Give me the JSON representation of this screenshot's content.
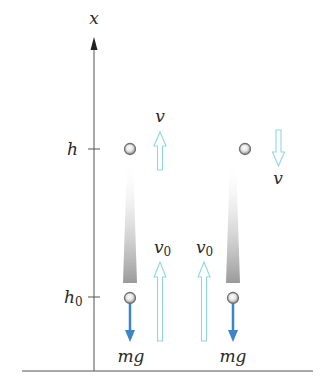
{
  "axis": {
    "label": "x",
    "ticks": [
      {
        "label": "h",
        "subscript": ""
      },
      {
        "label": "h",
        "subscript": "0"
      }
    ]
  },
  "labels": {
    "v_up": "v",
    "v_down": "v",
    "v0_left": {
      "base": "v",
      "sub": "0"
    },
    "v0_right": {
      "base": "v",
      "sub": "0"
    },
    "mg_left": "mg",
    "mg_right": "mg"
  },
  "colors": {
    "axis": "#555555",
    "velocity_arrow_outline": "#8fd8e0",
    "gravity_arrow": "#3a86c8",
    "ball_outer": "#7a7a7a",
    "ball_inner": "#f2f2f2",
    "trail": "#9a9a9a"
  }
}
